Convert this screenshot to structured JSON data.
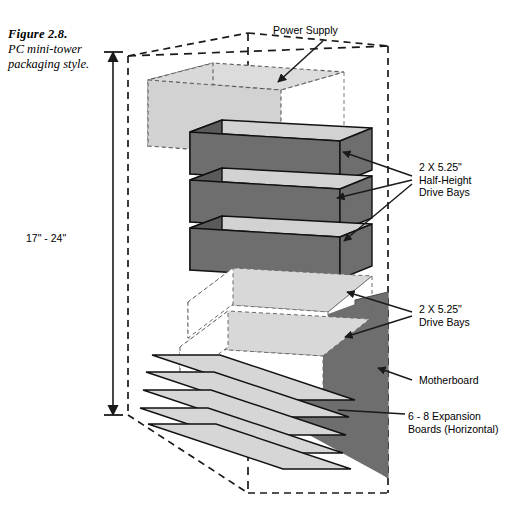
{
  "figure": {
    "number_label": "Figure 2.8.",
    "caption": "PC mini-tower packaging style."
  },
  "dimension": {
    "height_label": "17\" - 24\""
  },
  "annotations": {
    "power_supply": "Power Supply",
    "half_height_bays": {
      "line1": "2 X 5.25\"",
      "line2": "Half-Height",
      "line3": "Drive Bays"
    },
    "drive_bays": {
      "line1": "2 X 5.25\"",
      "line2": "Drive Bays"
    },
    "motherboard": "Motherboard",
    "expansion_boards": {
      "line1": "6 - 8 Expansion",
      "line2": "Boards (Horizontal)"
    }
  },
  "colors": {
    "line": "#1a1a1a",
    "dark_slab_front": "#6e6e6e",
    "dark_slab_side": "#5a5a5a",
    "slab_top": "#d2d2d2",
    "power_supply": "#d8d8d8",
    "motherboard": "#6e6e6e",
    "expansion_board": "#d6d6d6",
    "background": "#ffffff"
  }
}
